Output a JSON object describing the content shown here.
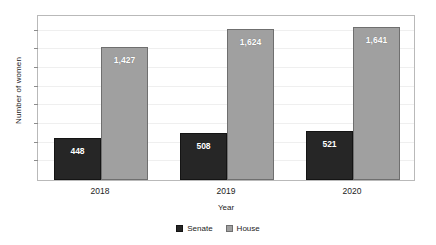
{
  "chart_data": {
    "type": "bar",
    "title": "",
    "subtitle": "",
    "xlabel": "Year",
    "ylabel": "Number of women",
    "categories": [
      "2018",
      "2019",
      "2020"
    ],
    "series": [
      {
        "name": "Senate",
        "color": "#262626",
        "values": [
          448,
          508,
          521
        ],
        "labels": [
          "448",
          "508",
          "521"
        ]
      },
      {
        "name": "House",
        "color": "#a0a0a0",
        "values": [
          1427,
          1624,
          1641
        ],
        "labels": [
          "1,427",
          "1,624",
          "1,641"
        ]
      }
    ],
    "ylim": [
      0,
      1780
    ],
    "y_tick_values": [
      200,
      400,
      600,
      800,
      1000,
      1200,
      1400,
      1600
    ],
    "y_tick_labels_visible": false,
    "grid": true,
    "legend_position": "bottom",
    "legend": [
      "Senate",
      "House"
    ]
  },
  "axes": {
    "y_title": "Number of women",
    "x_title": "Year"
  },
  "legend": {
    "items": [
      {
        "label": "Senate",
        "swatch": "legend-swatch-senate"
      },
      {
        "label": "House",
        "swatch": "legend-swatch-house"
      }
    ]
  }
}
